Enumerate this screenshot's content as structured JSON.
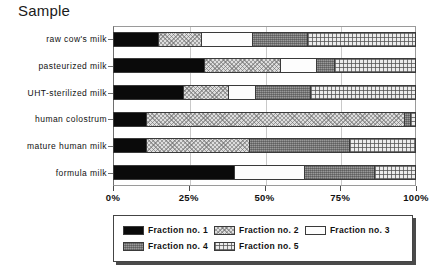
{
  "title": "Sample",
  "chart_data": {
    "type": "bar",
    "orientation": "horizontal",
    "stacked": true,
    "normalized_percent": true,
    "title": "Sample",
    "xlabel": "",
    "ylabel": "",
    "xlim": [
      0,
      100
    ],
    "xticks": [
      "0%",
      "25%",
      "50%",
      "75%",
      "100%"
    ],
    "xtick_values": [
      0,
      25,
      50,
      75,
      100
    ],
    "grid": false,
    "legend_position": "bottom",
    "categories": [
      "raw cow's milk",
      "pasteurized milk",
      "UHT-sterilized milk",
      "human colostrum",
      "mature human milk",
      "formula milk"
    ],
    "series": [
      {
        "name": "Fraction no. 1",
        "values": [
          15,
          30,
          23,
          11,
          11,
          40
        ]
      },
      {
        "name": "Fraction no. 2",
        "values": [
          14,
          25,
          15,
          85,
          34,
          0
        ]
      },
      {
        "name": "Fraction no. 3",
        "values": [
          17,
          12,
          9,
          0,
          0,
          23
        ]
      },
      {
        "name": "Fraction no. 4",
        "values": [
          18,
          6,
          18,
          2,
          33,
          23
        ]
      },
      {
        "name": "Fraction no. 5",
        "values": [
          36,
          27,
          35,
          2,
          22,
          14
        ]
      }
    ]
  },
  "legend": {
    "entries": [
      {
        "label": "Fraction no. 1",
        "swatch": "f1"
      },
      {
        "label": "Fraction no. 2",
        "swatch": "f2"
      },
      {
        "label": "Fraction no. 3",
        "swatch": "f3"
      },
      {
        "label": "Fraction no. 4",
        "swatch": "f4"
      },
      {
        "label": "Fraction no. 5",
        "swatch": "f5"
      }
    ]
  }
}
